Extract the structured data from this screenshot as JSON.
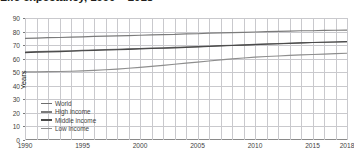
{
  "title": "Life expectancy, 1990 – 2018",
  "chart_data": {
    "type": "line",
    "title": "Life expectancy, 1990 – 2018",
    "xlabel": "",
    "ylabel": "Years",
    "xlim": [
      1990,
      2018
    ],
    "ylim": [
      0,
      90
    ],
    "grid": true,
    "legend_position": "inside-lower-left",
    "ytick_labels": [
      "90",
      "80",
      "70",
      "60",
      "50",
      "40",
      "30",
      "20",
      "10",
      "0"
    ],
    "ytick_values": [
      90,
      80,
      70,
      60,
      50,
      40,
      30,
      20,
      10,
      0
    ],
    "xtick_labels": [
      "1990",
      "1995",
      "2000",
      "2005",
      "2010",
      "2015",
      "2018"
    ],
    "xtick_values": [
      1990,
      1995,
      2000,
      2005,
      2010,
      2015,
      2018
    ],
    "x": [
      1990,
      1991,
      1992,
      1993,
      1994,
      1995,
      1996,
      1997,
      1998,
      1999,
      2000,
      2001,
      2002,
      2003,
      2004,
      2005,
      2006,
      2007,
      2008,
      2009,
      2010,
      2011,
      2012,
      2013,
      2014,
      2015,
      2016,
      2017,
      2018
    ],
    "series": [
      {
        "name": "World",
        "color": "#6e6e6e",
        "values": [
          64.9,
          65.2,
          65.4,
          65.6,
          65.8,
          66.1,
          66.4,
          66.7,
          66.9,
          67.2,
          67.5,
          67.8,
          68.0,
          68.3,
          68.6,
          68.9,
          69.3,
          69.6,
          69.9,
          70.2,
          70.5,
          70.8,
          71.1,
          71.4,
          71.7,
          71.9,
          72.1,
          72.3,
          72.6
        ]
      },
      {
        "name": "High income",
        "color": "#7b7b7b",
        "values": [
          75.0,
          75.2,
          75.5,
          75.6,
          75.9,
          76.1,
          76.4,
          76.6,
          76.8,
          77.0,
          77.3,
          77.5,
          77.7,
          77.9,
          78.3,
          78.4,
          78.8,
          79.0,
          79.2,
          79.4,
          79.7,
          79.9,
          80.1,
          80.3,
          80.6,
          80.6,
          80.9,
          81.0,
          81.1
        ]
      },
      {
        "name": "Middle income",
        "color": "#4a4a4a",
        "values": [
          64.5,
          64.8,
          65.0,
          65.2,
          65.5,
          65.8,
          66.1,
          66.4,
          66.6,
          66.9,
          67.2,
          67.5,
          67.7,
          68.0,
          68.3,
          68.7,
          69.0,
          69.4,
          69.7,
          70.0,
          70.4,
          70.7,
          71.0,
          71.3,
          71.6,
          71.9,
          72.1,
          72.3,
          72.6
        ]
      },
      {
        "name": "Low income",
        "color": "#8e8e8e",
        "values": [
          50.2,
          50.3,
          50.4,
          50.5,
          50.7,
          51.0,
          51.4,
          51.8,
          52.3,
          52.9,
          53.6,
          54.3,
          55.1,
          55.9,
          56.7,
          57.5,
          58.3,
          59.1,
          59.8,
          60.5,
          61.1,
          61.6,
          62.0,
          62.4,
          62.8,
          63.1,
          63.4,
          63.7,
          64.0
        ]
      }
    ]
  },
  "legend": [
    {
      "label": "World",
      "color": "#6e6e6e"
    },
    {
      "label": "High income",
      "color": "#7b7b7b"
    },
    {
      "label": "Middle income",
      "color": "#4a4a4a"
    },
    {
      "label": "Low income",
      "color": "#8e8e8e"
    }
  ]
}
